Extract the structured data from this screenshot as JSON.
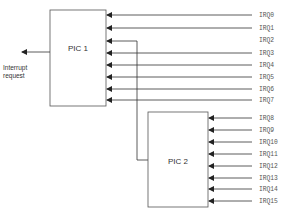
{
  "diagram": {
    "title": "",
    "pic1": {
      "label": "PIC 1"
    },
    "pic2": {
      "label": "PIC 2"
    },
    "output": {
      "label_line1": "Interrupt",
      "label_line2": "request"
    },
    "pic1_irqs": [
      "IRQ0",
      "IRQ1",
      "IRQ2",
      "IRQ3",
      "IRQ4",
      "IRQ5",
      "IRQ6",
      "IRQ7"
    ],
    "pic2_irqs": [
      "IRQ8",
      "IRQ9",
      "IRQ10",
      "IRQ11",
      "IRQ12",
      "IRQ13",
      "IRQ14",
      "IRQ15"
    ],
    "cascade": {
      "from": "PIC 2",
      "to": "IRQ2"
    },
    "colors": {
      "line": "#333333",
      "box_border": "#555555",
      "text": "#333333"
    }
  }
}
